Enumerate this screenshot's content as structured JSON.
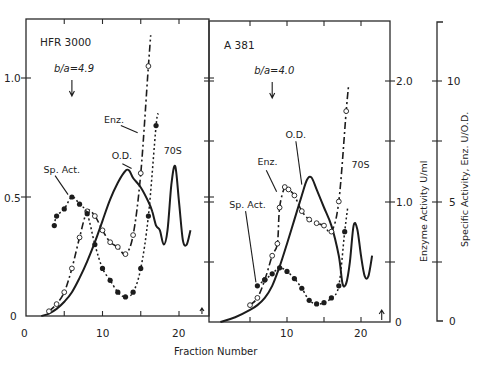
{
  "chart_data": [
    {
      "type": "line",
      "panel": "HFR 3000",
      "annotation": "b/a=4.9",
      "annotation_arrow_x": 6,
      "xlabel": "Fraction Number",
      "xlim": [
        0,
        24
      ],
      "xticks": [
        0,
        10,
        20
      ],
      "ylabel_left": "O.D.",
      "ylim": [
        0,
        1.2
      ],
      "yticks": [
        0,
        0.5,
        1.0
      ],
      "peak_label": "70S",
      "series": [
        {
          "name": "O.D.",
          "style": "solid",
          "x": [
            2,
            3,
            4,
            5,
            6,
            7,
            8,
            9,
            10,
            11,
            12,
            13,
            13.5,
            14,
            15,
            16,
            16.5,
            17,
            17.5,
            18,
            18.5,
            19,
            19.5,
            20,
            20.5,
            21,
            21.5
          ],
          "y": [
            0.0,
            0.01,
            0.03,
            0.06,
            0.1,
            0.16,
            0.23,
            0.31,
            0.4,
            0.49,
            0.56,
            0.61,
            0.61,
            0.58,
            0.54,
            0.48,
            0.44,
            0.38,
            0.36,
            0.3,
            0.36,
            0.55,
            0.63,
            0.48,
            0.32,
            0.3,
            0.36
          ]
        },
        {
          "name": "Enz.",
          "style": "dash-dot",
          "marker": "open-circle",
          "x": [
            3,
            4,
            5,
            6,
            7,
            8,
            9,
            10,
            11,
            12,
            13,
            14,
            15,
            16,
            16.3
          ],
          "y": [
            0.02,
            0.05,
            0.1,
            0.2,
            0.33,
            0.44,
            0.42,
            0.36,
            0.31,
            0.29,
            0.26,
            0.34,
            0.6,
            1.05,
            1.18
          ]
        },
        {
          "name": "Sp. Act.",
          "style": "dotted",
          "marker": "filled-circle",
          "x": [
            3.7,
            4,
            5,
            6,
            7,
            8,
            9,
            10,
            11,
            12,
            13,
            14,
            15,
            16,
            17,
            17.3
          ],
          "y": [
            0.38,
            0.42,
            0.45,
            0.5,
            0.47,
            0.43,
            0.3,
            0.2,
            0.15,
            0.1,
            0.08,
            0.1,
            0.2,
            0.42,
            0.8,
            0.85
          ]
        }
      ],
      "labels": [
        {
          "text": "Enz.",
          "x": 10.2,
          "y": 0.81
        },
        {
          "text": "O.D.",
          "x": 11.2,
          "y": 0.66
        },
        {
          "text": "Sp. Act.",
          "x": 2.3,
          "y": 0.6
        },
        {
          "text": "70S",
          "x": 18.0,
          "y": 0.68
        }
      ]
    },
    {
      "type": "line",
      "panel": "A 381",
      "annotation": "b/a=4.0",
      "annotation_arrow_x": 8,
      "xlabel": "Fraction Number",
      "xlim": [
        0,
        24
      ],
      "xticks": [
        10,
        20
      ],
      "ylabel_right": "Enzyme Activity U/ml",
      "ylim_right": [
        0,
        2.0
      ],
      "yticks_right": [
        0,
        1.0,
        2.0
      ],
      "ylabel_far_right": "Specific Activity, Enz. U/O.D.",
      "yticks_far_right": [
        0,
        5,
        10
      ],
      "peak_label": "70S",
      "series": [
        {
          "name": "O.D.",
          "style": "solid",
          "x": [
            1,
            3,
            5,
            6,
            7,
            8,
            9,
            10,
            11,
            12,
            12.7,
            13.3,
            14,
            15,
            16,
            17,
            17.5,
            18,
            18.5,
            19,
            19.5,
            20,
            20.5,
            21,
            21.5
          ],
          "y": [
            0.0,
            0.04,
            0.1,
            0.14,
            0.2,
            0.3,
            0.46,
            0.65,
            0.85,
            1.05,
            1.18,
            1.2,
            1.1,
            0.95,
            0.8,
            0.55,
            0.32,
            0.32,
            0.5,
            0.8,
            0.77,
            0.55,
            0.38,
            0.38,
            0.55
          ]
        },
        {
          "name": "Enz.",
          "style": "dash-dot",
          "marker": "open-circle",
          "x": [
            5,
            6,
            7,
            8,
            8.7,
            9,
            9.7,
            10.2,
            11,
            12,
            13,
            14,
            15,
            16,
            17,
            18,
            18.3
          ],
          "y": [
            0.14,
            0.2,
            0.35,
            0.55,
            0.65,
            0.95,
            1.12,
            1.1,
            1.05,
            0.92,
            0.85,
            0.82,
            0.8,
            0.75,
            1.0,
            1.75,
            1.95
          ]
        },
        {
          "name": "Sp. Act.",
          "style": "dotted",
          "marker": "filled-circle",
          "x": [
            6,
            7,
            8,
            9,
            10,
            11,
            12,
            13,
            14,
            15,
            16,
            17,
            17.8,
            18.2
          ],
          "y": [
            0.3,
            0.35,
            0.4,
            0.45,
            0.42,
            0.36,
            0.28,
            0.18,
            0.15,
            0.16,
            0.2,
            0.3,
            0.75,
            0.95
          ]
        }
      ],
      "labels": [
        {
          "text": "O.D.",
          "x": 9.8,
          "y": 1.53
        },
        {
          "text": "Enz.",
          "x": 6.0,
          "y": 1.3
        },
        {
          "text": "Sp. Act.",
          "x": 2.2,
          "y": 0.95
        },
        {
          "text": "70S",
          "x": 18.7,
          "y": 1.28
        }
      ]
    }
  ],
  "figure": {
    "xlabel": "Fraction Number",
    "left_yticks": [
      "0",
      "0.5",
      "1.0"
    ],
    "left_xticks": [
      "0",
      "10",
      "20"
    ],
    "right_xticks": [
      "10",
      "20"
    ],
    "enzyme_axis": {
      "label": "Enzyme Activity  U/ml",
      "ticks": [
        "0",
        "1.0",
        "2.0"
      ]
    },
    "specific_axis": {
      "label": "Specific Activity, Enz. U/O.D.",
      "ticks": [
        "0",
        "5",
        "10"
      ]
    },
    "panel_titles": [
      "HFR 3000",
      "A 381"
    ],
    "annotations": [
      "b/a = 4.9",
      "b/a = 4.0"
    ]
  }
}
